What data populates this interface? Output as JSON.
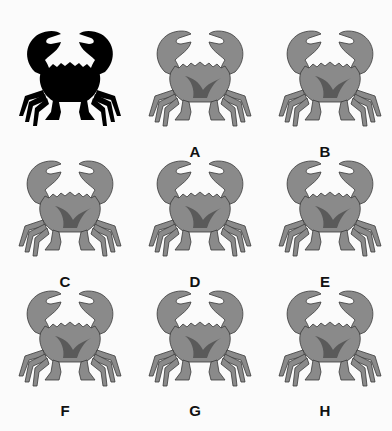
{
  "puzzle": {
    "target": {
      "name": "black-silhouette",
      "fill": "#000000"
    },
    "options": [
      {
        "label": "A",
        "variant": 1
      },
      {
        "label": "B",
        "variant": 2
      },
      {
        "label": "C",
        "variant": 3
      },
      {
        "label": "D",
        "variant": 4
      },
      {
        "label": "E",
        "variant": 5
      },
      {
        "label": "F",
        "variant": 6
      },
      {
        "label": "G",
        "variant": 7
      },
      {
        "label": "H",
        "variant": 8
      }
    ],
    "colors": {
      "crab_fill": "#8a8a8a",
      "crab_dark": "#5a5a5a",
      "crab_light": "#b4b4b4",
      "outline": "#3a3a3a"
    }
  }
}
